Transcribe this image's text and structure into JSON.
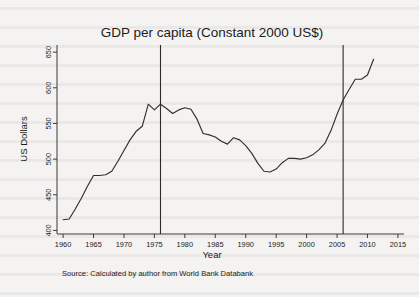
{
  "figure": {
    "title": "GDP per capita (Constant 2000 US$)",
    "source_note": "Source: Calculated by author from World Bank Databank"
  },
  "colors": {
    "page_background": "#f4f3f1",
    "series": "#303030",
    "axis": "#3a3a3a",
    "reference_line": "#2b2b2b",
    "text": "#1b1b1b"
  },
  "chart_data": {
    "type": "line",
    "title": "GDP per capita (Constant 2000 US$)",
    "xlabel": "Year",
    "ylabel": "US Dollars",
    "xlim": [
      1959,
      2016
    ],
    "ylim": [
      395,
      660
    ],
    "grid": false,
    "legend": "none",
    "xticks": [
      1960,
      1965,
      1970,
      1975,
      1980,
      1985,
      1990,
      1995,
      2000,
      2005,
      2010,
      2015
    ],
    "xtick_labels": [
      "1960",
      "1965",
      "1970",
      "1975",
      "1980",
      "1985",
      "1990",
      "1995",
      "2000",
      "2005",
      "2010",
      "2015"
    ],
    "yticks": [
      400,
      450,
      500,
      550,
      600,
      650
    ],
    "ytick_labels": [
      "400",
      "450",
      "500",
      "550",
      "600",
      "650"
    ],
    "annotations": [
      {
        "type": "vertical-reference-line",
        "x": 1976,
        "label": ""
      },
      {
        "type": "vertical-reference-line",
        "x": 2006,
        "label": ""
      }
    ],
    "series": [
      {
        "name": "GDP per capita",
        "x": [
          1960,
          1961,
          1962,
          1963,
          1964,
          1965,
          1966,
          1967,
          1968,
          1969,
          1970,
          1971,
          1972,
          1973,
          1974,
          1975,
          1976,
          1977,
          1978,
          1979,
          1980,
          1981,
          1982,
          1983,
          1984,
          1985,
          1986,
          1987,
          1988,
          1989,
          1990,
          1991,
          1992,
          1993,
          1994,
          1995,
          1996,
          1997,
          1998,
          1999,
          2000,
          2001,
          2002,
          2003,
          2004,
          2005,
          2006,
          2007,
          2008,
          2009,
          2010,
          2011
        ],
        "values": [
          415,
          416,
          430,
          445,
          462,
          477,
          477,
          478,
          483,
          497,
          512,
          527,
          539,
          546,
          577,
          569,
          577,
          571,
          564,
          569,
          572,
          570,
          556,
          536,
          534,
          531,
          525,
          521,
          530,
          527,
          519,
          508,
          494,
          483,
          482,
          486,
          495,
          501,
          501,
          500,
          502,
          506,
          513,
          522,
          540,
          563,
          583,
          598,
          612,
          612,
          618,
          640
        ]
      }
    ]
  },
  "axes": {
    "y_title": "US Dollars",
    "x_title": "Year"
  }
}
